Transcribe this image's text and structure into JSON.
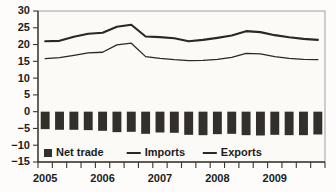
{
  "chart_data": {
    "type": "line",
    "title": "",
    "subtitle": "",
    "xlabel": "",
    "ylabel": "",
    "ylim": [
      -15,
      30
    ],
    "ytick_step": 5,
    "yticks": [
      30,
      25,
      20,
      15,
      10,
      5,
      0,
      -5,
      -10,
      -15
    ],
    "ytick_labels": [
      "30",
      "25",
      "20",
      "15",
      "10",
      "5",
      "0",
      "−5",
      "−10",
      "−15"
    ],
    "grid": false,
    "legend_position": "bottom-left-inside",
    "x_axis_type": "quarterly",
    "x_tick_labels_visible": [
      "2005",
      "2006",
      "2007",
      "2008",
      "2009"
    ],
    "x": [
      "2005 Q1",
      "2005 Q2",
      "2005 Q3",
      "2005 Q4",
      "2006 Q1",
      "2006 Q2",
      "2006 Q3",
      "2006 Q4",
      "2007 Q1",
      "2007 Q2",
      "2007 Q3",
      "2007 Q4",
      "2008 Q1",
      "2008 Q2",
      "2008 Q3",
      "2008 Q4",
      "2009 Q1",
      "2009 Q2",
      "2009 Q3",
      "2009 Q4"
    ],
    "categories": [
      "2005 Q1",
      "2005 Q2",
      "2005 Q3",
      "2005 Q4",
      "2006 Q1",
      "2006 Q2",
      "2006 Q3",
      "2006 Q4",
      "2007 Q1",
      "2007 Q2",
      "2007 Q3",
      "2007 Q4",
      "2008 Q1",
      "2008 Q2",
      "2008 Q3",
      "2008 Q4",
      "2009 Q1",
      "2009 Q2",
      "2009 Q3",
      "2009 Q4"
    ],
    "series": [
      {
        "name": "Net trade",
        "type": "bar",
        "values": [
          -5.2,
          -5.4,
          -5.4,
          -5.5,
          -5.7,
          -6.1,
          -6.0,
          -6.6,
          -6.2,
          -6.3,
          -6.9,
          -7.0,
          -6.7,
          -6.6,
          -7.0,
          -7.1,
          -6.9,
          -7.0,
          -7.0,
          -6.8
        ]
      },
      {
        "name": "Imports",
        "type": "line",
        "values": [
          21.0,
          21.1,
          22.3,
          23.2,
          23.5,
          25.3,
          25.9,
          22.4,
          22.2,
          21.9,
          21.0,
          21.4,
          22.0,
          22.7,
          24.0,
          23.7,
          22.8,
          22.2,
          21.7,
          21.4
        ]
      },
      {
        "name": "Exports",
        "type": "line",
        "values": [
          15.8,
          16.1,
          16.8,
          17.5,
          17.7,
          19.9,
          20.4,
          16.4,
          15.9,
          15.5,
          15.2,
          15.3,
          15.6,
          16.2,
          17.4,
          17.2,
          16.4,
          15.9,
          15.6,
          15.5
        ]
      }
    ],
    "legend": [
      {
        "label": "Net trade",
        "marker": "square",
        "color": "#332f2b"
      },
      {
        "label": "Imports",
        "marker": "line",
        "color": "#2a2724"
      },
      {
        "label": "Exports",
        "marker": "line",
        "color": "#2a2724"
      }
    ]
  },
  "colors": {
    "net_trade": "#332f2b",
    "imports": "#2a2724",
    "exports": "#2a2724",
    "axis": "#3a3632",
    "background": "#fdfcfa"
  }
}
